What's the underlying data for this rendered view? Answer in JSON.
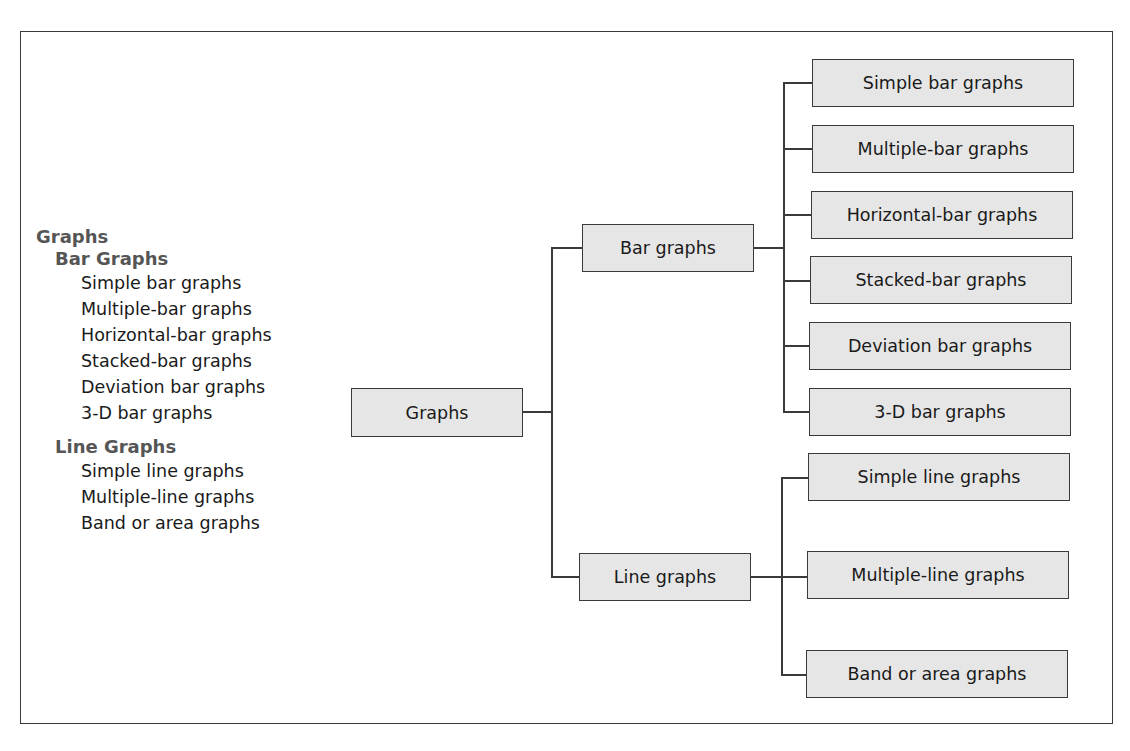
{
  "outline": {
    "title": "Graphs",
    "sections": [
      {
        "heading": "Bar Graphs",
        "items": [
          "Simple bar graphs",
          "Multiple-bar graphs",
          "Horizontal-bar graphs",
          "Stacked-bar graphs",
          "Deviation bar graphs",
          "3-D bar graphs"
        ]
      },
      {
        "heading": "Line Graphs",
        "items": [
          "Simple line graphs",
          "Multiple-line graphs",
          "Band or area graphs"
        ]
      }
    ]
  },
  "tree": {
    "root": "Graphs",
    "bar": {
      "label": "Bar graphs",
      "children": [
        "Simple bar graphs",
        "Multiple-bar graphs",
        "Horizontal-bar graphs",
        "Stacked-bar graphs",
        "Deviation bar graphs",
        "3-D bar graphs"
      ]
    },
    "line": {
      "label": "Line graphs",
      "children": [
        "Simple line graphs",
        "Multiple-line graphs",
        "Band or area graphs"
      ]
    }
  },
  "colors": {
    "box_fill": "#e6e6e6",
    "line": "#3a3a3a",
    "heading": "#555555",
    "text": "#1a1a1a"
  }
}
